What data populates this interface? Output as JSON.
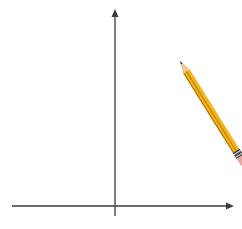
{
  "figure": {
    "equation_label": "y = x²",
    "x_axis_label": "x",
    "y_axis_label": "y",
    "x_tick_labels": [
      "−3",
      "−2",
      "−1",
      "0",
      "1",
      "2",
      "3"
    ],
    "y_tick_labels": [
      "1",
      "2",
      "3",
      "4",
      "5",
      "6"
    ],
    "colors": {
      "grid": "#c8c8c8",
      "axis": "#3a3a3a",
      "curve": "#2b2b4a",
      "shade": "#e6e8ea",
      "pencil_body": "#f2b51c",
      "pencil_stripe": "#c98a10",
      "pencil_wood": "#e8c99a",
      "eraser": "#e8a7a0"
    },
    "pencil_tip": {
      "x": 2.2,
      "y": 4.8
    }
  },
  "chart_data": {
    "type": "line",
    "title": "",
    "xlabel": "x",
    "ylabel": "y",
    "xlim": [
      -3.4,
      4.0
    ],
    "ylim": [
      -0.5,
      6.5
    ],
    "grid": true,
    "grid_step": 0.5,
    "x_ticks": [
      -3,
      -2,
      -1,
      0,
      1,
      2,
      3
    ],
    "y_ticks": [
      1,
      2,
      3,
      4,
      5,
      6
    ],
    "series": [
      {
        "name": "y = x²",
        "function": "x^2",
        "x": [
          -2.5,
          -2,
          -1.5,
          -1,
          -0.5,
          0,
          0.5,
          1,
          1.5,
          2,
          2.2
        ],
        "y": [
          6.25,
          4,
          2.25,
          1,
          0.25,
          0,
          0.25,
          1,
          2.25,
          4,
          4.84
        ],
        "drawn_until_x": 2.2,
        "shaded_region": "y ≥ x²"
      }
    ],
    "annotations": [
      {
        "text": "y = x²",
        "x": -2.7,
        "y": 4
      },
      {
        "type": "pencil",
        "tip": [
          2.2,
          4.8
        ]
      }
    ]
  }
}
